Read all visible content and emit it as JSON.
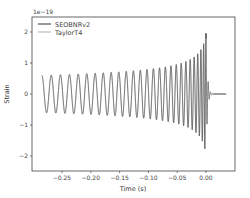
{
  "chart_data": {
    "type": "line",
    "title": "",
    "xlabel": "Time (s)",
    "ylabel": "Strain",
    "y_offset_label": "1e−19",
    "xlim": [
      -0.31,
      0.05
    ],
    "ylim": [
      -2.5,
      2.5
    ],
    "xticks": [
      -0.25,
      -0.2,
      -0.15,
      -0.1,
      -0.05,
      0.0
    ],
    "xtick_labels": [
      "−0.25",
      "−0.20",
      "−0.15",
      "−0.10",
      "−0.05",
      "0.00"
    ],
    "yticks": [
      2,
      1,
      0,
      -1,
      -2
    ],
    "ytick_labels": [
      "2",
      "1",
      "0",
      "−1",
      "−2"
    ],
    "grid": false,
    "legend_position": "upper left",
    "series": [
      {
        "name": "SEOBNRv2",
        "color": "#555555",
        "description": "Inspiral-merger-ringdown chirp; amplitude grows from ~0.6 at t=-0.285 to peak ~2.25 near t=0, ringdown decays to 0 by t~0.03",
        "t_start": -0.285,
        "t_end": 0.035,
        "amp_start": 0.6,
        "amp_peak": 2.25,
        "trough_peak": -2.2,
        "approx_cycles": 28
      },
      {
        "name": "TaylorT4",
        "color": "#bbbbbb",
        "description": "Post-Newtonian inspiral; overlaps SEOBNRv2 through inspiral, truncates near t=0",
        "t_start": -0.285,
        "t_end": 0.0,
        "amp_start": 0.6,
        "amp_peak": 2.1
      }
    ]
  },
  "legend": {
    "items": [
      {
        "label": "SEOBNRv2",
        "color": "#555555"
      },
      {
        "label": "TaylorT4",
        "color": "#bbbbbb"
      }
    ]
  },
  "frame": {
    "left": 32,
    "top": 17,
    "right": 235,
    "bottom": 171
  }
}
